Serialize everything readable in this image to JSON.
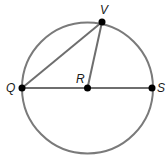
{
  "diagram": {
    "type": "circle-geometry",
    "circle": {
      "cx": 87.5,
      "cy": 88,
      "r": 65.5,
      "stroke": "#7a7a7a"
    },
    "points": {
      "Q": {
        "label": "Q",
        "x": 22,
        "y": 88,
        "lx": 6,
        "ly": 92
      },
      "R": {
        "label": "R",
        "x": 87.5,
        "y": 88,
        "lx": 76,
        "ly": 83
      },
      "S": {
        "label": "S",
        "x": 152,
        "y": 88,
        "lx": 157,
        "ly": 92
      },
      "V": {
        "label": "V",
        "x": 102,
        "y": 22,
        "lx": 100,
        "ly": 14
      }
    },
    "segments": [
      {
        "from": "Q",
        "to": "S",
        "name": "diameter-QS"
      },
      {
        "from": "Q",
        "to": "V",
        "name": "chord-QV"
      },
      {
        "from": "R",
        "to": "V",
        "name": "radius-RV"
      }
    ],
    "line_color": "#6e6e6e",
    "point_color": "#000000"
  }
}
